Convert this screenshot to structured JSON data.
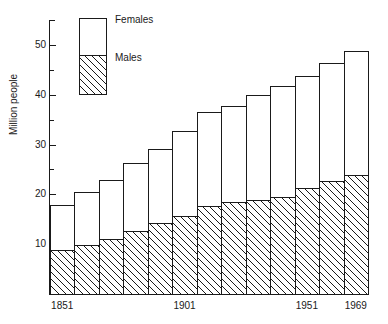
{
  "chart_data": {
    "type": "bar",
    "subtype": "stacked-bar",
    "title": "",
    "subtitle": "",
    "xlabel": "",
    "ylabel": "Million people",
    "ylim": [
      0,
      55
    ],
    "xlim_labels": [
      "1851",
      "1969"
    ],
    "grid": false,
    "legend_position": "inside-top-left",
    "y_ticks_major": [
      10,
      20,
      30,
      40,
      50
    ],
    "y_ticks_minor": [
      5,
      15,
      25,
      35,
      45,
      55
    ],
    "y_tick_labels": [
      "10",
      "20",
      "30",
      "40",
      "50"
    ],
    "categories": [
      "1851",
      "1861",
      "1871",
      "1881",
      "1891",
      "1901",
      "1911",
      "1921",
      "1931",
      "1941",
      "1951",
      "1961",
      "1969"
    ],
    "x_tick_labels_shown": [
      "1851",
      "1901",
      "1951",
      "1969"
    ],
    "series": [
      {
        "name": "Males",
        "fill": "hatched",
        "values": [
          8.8,
          9.8,
          11.0,
          12.6,
          14.3,
          15.7,
          17.7,
          18.4,
          18.9,
          19.5,
          21.2,
          22.6,
          23.8
        ]
      },
      {
        "name": "Females",
        "fill": "white",
        "values": [
          9.1,
          10.6,
          11.9,
          13.7,
          14.9,
          17.0,
          18.9,
          19.4,
          21.1,
          22.3,
          22.6,
          23.8,
          25.0
        ]
      }
    ],
    "totals": [
      17.9,
      20.4,
      22.9,
      26.3,
      29.2,
      32.7,
      36.6,
      37.8,
      40.0,
      41.8,
      43.8,
      46.4,
      48.8
    ]
  },
  "legend": {
    "females_label": "Females",
    "males_label": "Males"
  },
  "axes": {
    "y_title": "Million people"
  }
}
